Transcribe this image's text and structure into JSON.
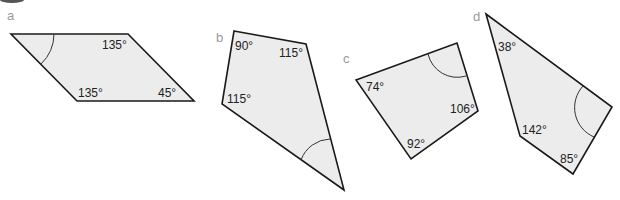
{
  "figure": {
    "shapes": [
      {
        "letter": "a",
        "angles": [
          "135°",
          "135°",
          "45°"
        ],
        "unknown_angle_marked": true
      },
      {
        "letter": "b",
        "angles": [
          "90°",
          "115°",
          "115°"
        ],
        "unknown_angle_marked": true
      },
      {
        "letter": "c",
        "angles": [
          "74°",
          "106°",
          "92°"
        ],
        "unknown_angle_marked": true
      },
      {
        "letter": "d",
        "angles": [
          "38°",
          "142°",
          "85°"
        ],
        "unknown_angle_marked": true
      }
    ],
    "colors": {
      "fill": "#ececec",
      "stroke": "#1a1a1a",
      "letter": "#9a9a9a"
    }
  }
}
